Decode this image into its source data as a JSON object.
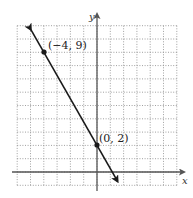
{
  "chart_data": {
    "type": "line",
    "title": "",
    "xlabel": "x",
    "ylabel": "y",
    "xlim": [
      -6,
      6
    ],
    "ylim": [
      -1,
      11
    ],
    "grid": true,
    "grid_style": "dotted",
    "series": [
      {
        "name": "line",
        "points": [
          {
            "x": -4,
            "y": 9
          },
          {
            "x": 0,
            "y": 2
          }
        ],
        "slope": -1.75,
        "intercept": 2,
        "arrows": "both",
        "color": "#1a1a1a"
      }
    ],
    "annotations": [
      {
        "x": -4,
        "y": 9,
        "text": "(−4, 9)"
      },
      {
        "x": 0,
        "y": 2,
        "text": "(0, 2)"
      }
    ]
  },
  "labels": {
    "x_axis": "x",
    "y_axis": "y",
    "point_a": "(−4, 9)",
    "point_b": "(0, 2)"
  }
}
